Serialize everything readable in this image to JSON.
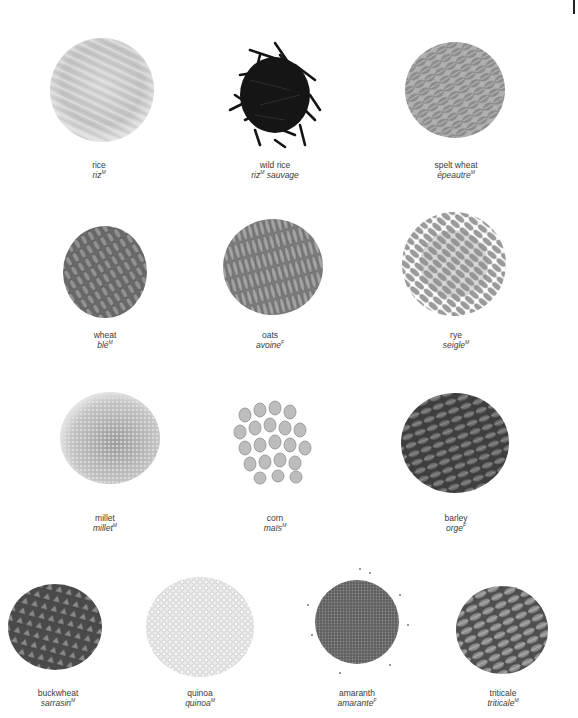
{
  "page": {
    "background": "#ffffff",
    "text_color": "#3a3a3a"
  },
  "grains": [
    {
      "id": "rice",
      "english": "rice",
      "french": "riz",
      "french_suffix": "",
      "gender": "M",
      "color": "#cfcfcf",
      "texture": "long-light"
    },
    {
      "id": "wild-rice",
      "english": "wild rice",
      "french": "riz",
      "french_suffix": " sauvage",
      "gender": "M",
      "color": "#1a1a1a",
      "texture": "long-dark"
    },
    {
      "id": "spelt-wheat",
      "english": "spelt wheat",
      "french": "épeautre",
      "french_suffix": "",
      "gender": "M",
      "color": "#9a9a9a",
      "texture": "oval"
    },
    {
      "id": "wheat",
      "english": "wheat",
      "french": "blé",
      "french_suffix": "",
      "gender": "M",
      "color": "#6e6e6e",
      "texture": "oval-dark"
    },
    {
      "id": "oats",
      "english": "oats",
      "french": "avoine",
      "french_suffix": "",
      "gender": "F",
      "color": "#8a8a8a",
      "texture": "long-mid"
    },
    {
      "id": "rye",
      "english": "rye",
      "french": "seigle",
      "french_suffix": "",
      "gender": "M",
      "color": "#9c9c9c",
      "texture": "oval-light"
    },
    {
      "id": "millet",
      "english": "millet",
      "french": "millet",
      "french_suffix": "",
      "gender": "M",
      "color": "#b5b5b5",
      "texture": "fine"
    },
    {
      "id": "corn",
      "english": "corn",
      "french": "maïs",
      "french_suffix": "",
      "gender": "M",
      "color": "#bdbdbd",
      "texture": "kernel"
    },
    {
      "id": "barley",
      "english": "barley",
      "french": "orge",
      "french_suffix": "",
      "gender": "F",
      "color": "#555555",
      "texture": "oval-dark"
    },
    {
      "id": "buckwheat",
      "english": "buckwheat",
      "french": "sarrasin",
      "french_suffix": "",
      "gender": "M",
      "color": "#6a6a6a",
      "texture": "triangle"
    },
    {
      "id": "quinoa",
      "english": "quinoa",
      "french": "quinoa",
      "french_suffix": "",
      "gender": "M",
      "color": "#d8d8d8",
      "texture": "fine-light"
    },
    {
      "id": "amaranth",
      "english": "amaranth",
      "french": "amarante",
      "french_suffix": "",
      "gender": "F",
      "color": "#6b6b6b",
      "texture": "fine-dark"
    },
    {
      "id": "triticale",
      "english": "triticale",
      "french": "triticale",
      "french_suffix": "",
      "gender": "M",
      "color": "#7d7d7d",
      "texture": "oval"
    }
  ]
}
